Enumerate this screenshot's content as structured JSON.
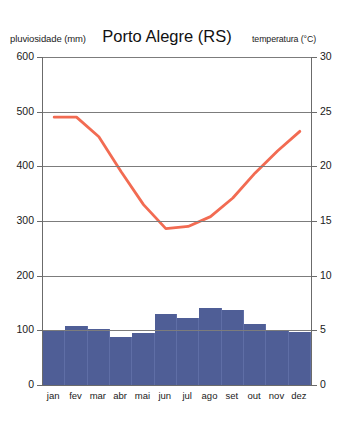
{
  "header": {
    "left_axis_label": "pluviosidade (mm)",
    "title": "Porto Alegre (RS)",
    "right_axis_label": "temperatura (°C)"
  },
  "colors": {
    "bar": "#4f5e96",
    "line": "#f26b52",
    "grid": "#7c7c7c",
    "axis": "#6b6b6b",
    "background": "#ffffff"
  },
  "chart_data": {
    "type": "bar",
    "title": "Porto Alegre (RS)",
    "xlabel": "",
    "ylabel": "pluviosidade (mm)",
    "y2label": "temperatura (°C)",
    "grid": true,
    "legend": "none",
    "categories": [
      "jan",
      "fev",
      "mar",
      "abr",
      "mai",
      "jun",
      "jul",
      "ago",
      "set",
      "out",
      "nov",
      "dez"
    ],
    "ylim": [
      0,
      600
    ],
    "yticks": [
      0,
      100,
      200,
      300,
      400,
      500,
      600
    ],
    "y2lim": [
      0,
      30
    ],
    "y2ticks": [
      0,
      5,
      10,
      15,
      20,
      25,
      30
    ],
    "series": [
      {
        "name": "pluviosidade",
        "type": "bar",
        "axis": "left",
        "unit": "mm",
        "values": [
          98,
          108,
          102,
          88,
          95,
          130,
          122,
          140,
          138,
          112,
          100,
          97
        ]
      },
      {
        "name": "temperatura",
        "type": "line",
        "axis": "right",
        "unit": "°C",
        "values": [
          24.5,
          24.5,
          22.7,
          19.5,
          16.5,
          14.3,
          14.5,
          15.4,
          17.1,
          19.4,
          21.4,
          23.2
        ]
      }
    ]
  }
}
